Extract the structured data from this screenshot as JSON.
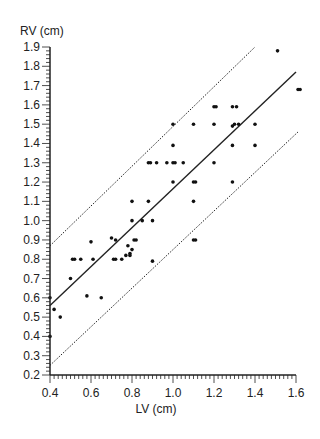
{
  "chart_data": {
    "type": "scatter",
    "title": "",
    "xlabel": "LV (cm)",
    "ylabel": "RV (cm)",
    "xlim": [
      0.4,
      1.6
    ],
    "ylim": [
      0.2,
      1.9
    ],
    "x_ticks": [
      "0.4",
      "0.6",
      "0.8",
      "1.0",
      "1.2",
      "1.4",
      "1.6"
    ],
    "y_ticks": [
      "0.2",
      "0.3",
      "0.4",
      "0.5",
      "0.6",
      "0.7",
      "0.8",
      "0.9",
      "1.0",
      "1.1",
      "1.2",
      "1.3",
      "1.4",
      "1.5",
      "1.6",
      "1.7",
      "1.8",
      "1.9"
    ],
    "grid": false,
    "legend": null,
    "series": [
      {
        "name": "observations",
        "marker": "dot",
        "points": [
          [
            0.4,
            0.6
          ],
          [
            0.42,
            0.54
          ],
          [
            0.45,
            0.5
          ],
          [
            0.4,
            0.4
          ],
          [
            0.5,
            0.7
          ],
          [
            0.51,
            0.8
          ],
          [
            0.52,
            0.8
          ],
          [
            0.55,
            0.8
          ],
          [
            0.6,
            0.89
          ],
          [
            0.61,
            0.8
          ],
          [
            0.58,
            0.61
          ],
          [
            0.65,
            0.6
          ],
          [
            0.7,
            0.91
          ],
          [
            0.72,
            0.9
          ],
          [
            0.71,
            0.8
          ],
          [
            0.72,
            0.8
          ],
          [
            0.75,
            0.8
          ],
          [
            0.77,
            0.82
          ],
          [
            0.79,
            0.83
          ],
          [
            0.79,
            0.82
          ],
          [
            0.8,
            0.85
          ],
          [
            0.78,
            0.87
          ],
          [
            0.81,
            0.9
          ],
          [
            0.82,
            0.9
          ],
          [
            0.9,
            0.79
          ],
          [
            0.8,
            1.0
          ],
          [
            0.85,
            1.0
          ],
          [
            0.9,
            1.0
          ],
          [
            0.8,
            1.1
          ],
          [
            0.88,
            1.1
          ],
          [
            0.88,
            1.3
          ],
          [
            0.89,
            1.3
          ],
          [
            0.92,
            1.3
          ],
          [
            0.97,
            1.3
          ],
          [
            1.0,
            1.3
          ],
          [
            1.01,
            1.3
          ],
          [
            1.05,
            1.3
          ],
          [
            1.0,
            1.2
          ],
          [
            1.0,
            1.39
          ],
          [
            1.0,
            1.5
          ],
          [
            1.1,
            1.5
          ],
          [
            1.1,
            1.2
          ],
          [
            1.11,
            1.2
          ],
          [
            1.1,
            1.1
          ],
          [
            1.1,
            0.9
          ],
          [
            1.11,
            0.9
          ],
          [
            1.2,
            1.3
          ],
          [
            1.2,
            1.5
          ],
          [
            1.2,
            1.59
          ],
          [
            1.21,
            1.59
          ],
          [
            1.29,
            1.59
          ],
          [
            1.31,
            1.59
          ],
          [
            1.29,
            1.49
          ],
          [
            1.3,
            1.5
          ],
          [
            1.32,
            1.5
          ],
          [
            1.4,
            1.5
          ],
          [
            1.29,
            1.39
          ],
          [
            1.4,
            1.39
          ],
          [
            1.29,
            1.2
          ],
          [
            1.51,
            1.88
          ],
          [
            1.61,
            1.68
          ],
          [
            1.62,
            1.68
          ]
        ]
      }
    ],
    "lines": [
      {
        "name": "regression",
        "style": "solid",
        "from": [
          0.4,
          0.56
        ],
        "to": [
          1.6,
          1.77
        ]
      },
      {
        "name": "upper-limit",
        "style": "dotted",
        "from": [
          0.4,
          0.87
        ],
        "to": [
          1.4,
          1.9
        ]
      },
      {
        "name": "lower-limit",
        "style": "dotted",
        "from": [
          0.4,
          0.25
        ],
        "to": [
          1.61,
          1.46
        ]
      }
    ]
  },
  "colors": {
    "axis": "#222222",
    "points": "#111111",
    "lines": "#222222",
    "background": "#ffffff"
  }
}
